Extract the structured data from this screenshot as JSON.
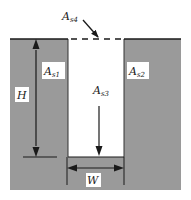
{
  "diagram": {
    "colors": {
      "solid": "#9a9a9a",
      "cavity": "#ffffff",
      "line": "#1a1a1a",
      "label_bg": "#ffffff"
    },
    "labels": {
      "as1": {
        "base": "A",
        "sub": "s1"
      },
      "as2": {
        "base": "A",
        "sub": "s2"
      },
      "as3": {
        "base": "A",
        "sub": "s3"
      },
      "as4": {
        "base": "A",
        "sub": "s4"
      },
      "height": "H",
      "width": "W"
    }
  }
}
